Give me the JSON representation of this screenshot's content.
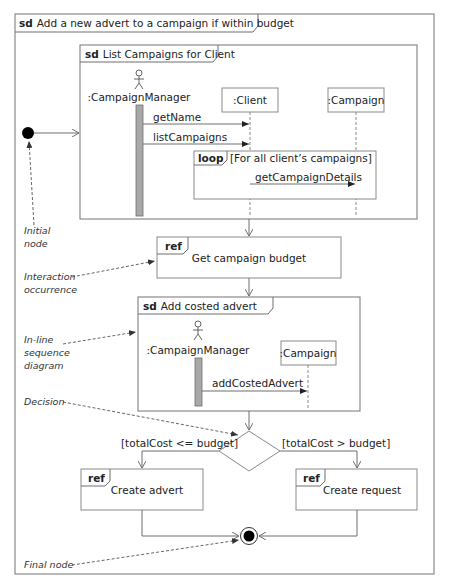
{
  "outer_frame": {
    "keyword": "sd",
    "title": "Add a new advert to a campaign if within budget"
  },
  "list_campaigns_frame": {
    "keyword": "sd",
    "title": "List Campaigns for Client",
    "lifelines": {
      "actor": ":CampaignManager",
      "client": ":Client",
      "campaign": ":Campaign"
    },
    "messages": [
      "getName",
      "listCampaigns",
      "getCampaignDetails"
    ],
    "loop": {
      "keyword": "loop",
      "guard": "[For all client’s campaigns]"
    }
  },
  "ref_budget": {
    "keyword": "ref",
    "label": "Get campaign budget"
  },
  "add_costed_frame": {
    "keyword": "sd",
    "title": "Add costed advert",
    "lifelines": {
      "actor": ":CampaignManager",
      "campaign": ":Campaign"
    },
    "messages": [
      "addCostedAdvert"
    ]
  },
  "decision": {
    "left_guard": "[totalCost <= budget]",
    "right_guard": "[totalCost > budget]"
  },
  "ref_create_advert": {
    "keyword": "ref",
    "label": "Create advert"
  },
  "ref_create_request": {
    "keyword": "ref",
    "label": "Create request"
  },
  "annotations": {
    "initial_node": [
      "Initial",
      "node"
    ],
    "interaction_occurrence": [
      "Interaction",
      "occurrence"
    ],
    "inline_sequence": [
      "In-line",
      "sequence",
      "diagram"
    ],
    "decision": "Decision",
    "final_node": "Final node"
  },
  "colors": {
    "frame_stroke": "#8a8a8a",
    "activation_fill": "#a8a8a8",
    "node_fill": "#000000"
  }
}
